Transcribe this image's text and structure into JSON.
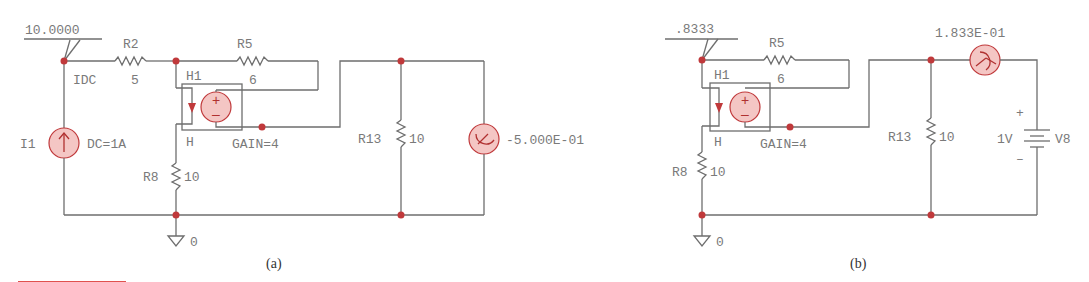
{
  "circuit_a": {
    "caption": "(a)",
    "node_voltage": "10.0000",
    "r2": {
      "name": "R2",
      "value": "5"
    },
    "r5": {
      "name": "R5",
      "value": "6"
    },
    "r8": {
      "name": "R8",
      "value": "10"
    },
    "r13": {
      "name": "R13",
      "value": "10"
    },
    "h1": {
      "name": "H1",
      "sub": "H",
      "gain": "GAIN=4"
    },
    "i1": {
      "name": "I1",
      "value": "DC=1A"
    },
    "idc_label": "IDC",
    "ammeter_reading": "-5.000E-01",
    "ground": "0"
  },
  "circuit_b": {
    "caption": "(b)",
    "node_voltage": ".8333",
    "r5": {
      "name": "R5",
      "value": "6"
    },
    "r8": {
      "name": "R8",
      "value": "10"
    },
    "r13": {
      "name": "R13",
      "value": "10"
    },
    "h1": {
      "name": "H1",
      "sub": "H",
      "gain": "GAIN=4"
    },
    "v8": {
      "name": "V8",
      "value": "1V",
      "plus": "+",
      "minus": "–"
    },
    "ammeter_reading": "1.833E-01",
    "ground": "0"
  },
  "colors": {
    "wire": "#6e6e6e",
    "node": "#c0393b",
    "source_fill": "#f4c6c4",
    "accent_line": "#e0524f"
  }
}
